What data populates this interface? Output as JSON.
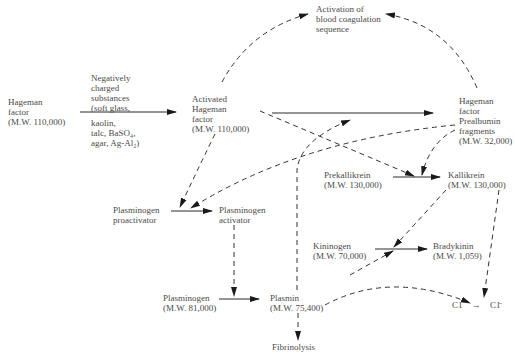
{
  "nodes": {
    "hageman_factor": {
      "lines": [
        "Hageman",
        "factor",
        "(M.W. 110,000)"
      ]
    },
    "activators": {
      "top_lines": [
        "Negatively",
        "charged",
        "substances",
        "(soft glass,"
      ],
      "bottom_lines": [
        "kaolin,",
        "talc, BaSO₄,",
        "agar, Ag-Al₂)"
      ]
    },
    "activated_hageman": {
      "lines": [
        "Activated",
        "Hageman",
        "factor",
        "(M.W. 110,000)"
      ]
    },
    "coagulation": {
      "lines": [
        "Activation of",
        "blood coagulation",
        "sequence"
      ]
    },
    "hf_fragments": {
      "lines": [
        "Hageman",
        "factor",
        "Prealbumin",
        "fragments",
        "(M.W. 32,000)"
      ]
    },
    "prekallikrein": {
      "lines": [
        "Prekallikrein",
        "(M.W. 130,000)"
      ]
    },
    "kallikrein": {
      "lines": [
        "Kallikrein",
        "(M.W. 130,000)"
      ]
    },
    "plasminogen_proactivator": {
      "lines": [
        "Plasminogen",
        "proactivator"
      ]
    },
    "plasminogen_activator": {
      "lines": [
        "Plasminogen",
        "activator"
      ]
    },
    "kininogen": {
      "lines": [
        "Kininogen",
        "(M.W. 70,000)"
      ]
    },
    "bradykinin": {
      "lines": [
        "Bradykinin",
        "(M.W. 1,059)"
      ]
    },
    "plasminogen": {
      "lines": [
        "Plasminogen",
        "(M.W. 81,000)"
      ]
    },
    "plasmin": {
      "lines": [
        "Plasmin",
        "(M.W. 75,400)"
      ]
    },
    "fibrinolysis": {
      "lines": [
        "Fibrinolysis"
      ]
    },
    "c1": {
      "label": "C1",
      "arrow": "→",
      "label_active": "C1̄"
    }
  },
  "colors": {
    "text": "#4a4a4a",
    "line": "#2a2a2a",
    "background": "#ffffff"
  }
}
